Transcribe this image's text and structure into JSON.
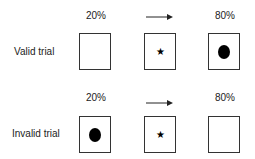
{
  "rows": [
    {
      "label": "Valid trial",
      "left_pct": "20%",
      "right_pct": "80%",
      "boxes": [
        "empty",
        "star",
        "dot"
      ]
    },
    {
      "label": "Invalid trial",
      "left_pct": "20%",
      "right_pct": "80%",
      "boxes": [
        "dot",
        "star",
        "empty"
      ]
    }
  ],
  "symbols": {
    "star": "★"
  }
}
